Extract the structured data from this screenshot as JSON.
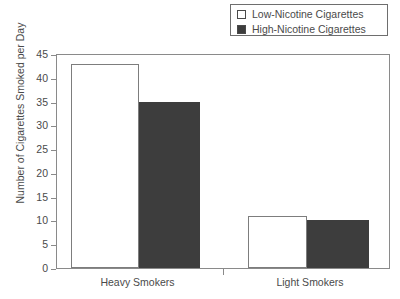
{
  "chart_data": {
    "type": "bar",
    "title": "",
    "xlabel": "",
    "ylabel": "Number of Cigarettes Smoked per Day",
    "categories": [
      "Heavy Smokers",
      "Light Smokers"
    ],
    "series": [
      {
        "name": "Low-Nicotine Cigarettes",
        "color": "#ffffff",
        "values": [
          43,
          11
        ]
      },
      {
        "name": "High-Nicotine Cigarettes",
        "color": "#3d3d3d",
        "values": [
          35,
          10
        ]
      }
    ],
    "ylim": [
      0,
      45
    ],
    "ytick_step": 5,
    "ytick_labels": [
      "45",
      "40",
      "35",
      "30",
      "25",
      "20",
      "15",
      "10",
      "5",
      "0"
    ],
    "ytick_values": [
      45,
      40,
      35,
      30,
      25,
      20,
      15,
      10,
      5,
      0
    ],
    "grid": false,
    "legend_position": "top-right"
  },
  "legend": {
    "entries": [
      {
        "label": "Low-Nicotine Cigarettes",
        "swatch": "#ffffff"
      },
      {
        "label": "High-Nicotine Cigarettes",
        "swatch": "#3d3d3d"
      }
    ]
  },
  "axes": {
    "y_title": "Number of Cigarettes Smoked per Day",
    "x_labels": [
      "Heavy Smokers",
      "Light Smokers"
    ]
  }
}
